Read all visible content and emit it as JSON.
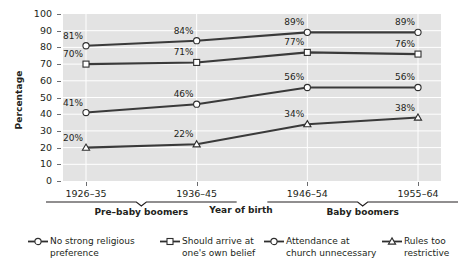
{
  "chart_data": {
    "type": "line",
    "title": "",
    "xlabel": "Year of birth",
    "ylabel": "Percentage",
    "ylim": [
      0,
      100
    ],
    "yticks": [
      "0",
      "10",
      "20",
      "30",
      "40",
      "50",
      "60",
      "70",
      "80",
      "90",
      "100"
    ],
    "grid": "horizontal-and-vertical",
    "legend_position": "bottom",
    "categories": [
      "1926–35",
      "1936–45",
      "1946–54",
      "1955–64"
    ],
    "category_groups": [
      {
        "label": "Pre–baby boomers",
        "categories": [
          "1926–35",
          "1936–45"
        ]
      },
      {
        "label": "Baby boomers",
        "categories": [
          "1946–54",
          "1955–64"
        ]
      }
    ],
    "series": [
      {
        "name": "No strong religious preference",
        "marker": "circle",
        "values": [
          81,
          84,
          89,
          89
        ],
        "labels": [
          "81%",
          "84%",
          "89%",
          "89%"
        ]
      },
      {
        "name": "Should arrive at one's own belief",
        "marker": "square",
        "values": [
          70,
          71,
          77,
          76
        ],
        "labels": [
          "70%",
          "71%",
          "77%",
          "76%"
        ]
      },
      {
        "name": "Attendance at church unnecessary",
        "marker": "circle",
        "values": [
          41,
          46,
          56,
          56
        ],
        "labels": [
          "41%",
          "46%",
          "56%",
          "56%"
        ]
      },
      {
        "name": "Rules too restrictive",
        "marker": "triangle",
        "values": [
          20,
          22,
          34,
          38
        ],
        "labels": [
          "20%",
          "22%",
          "34%",
          "38%"
        ]
      }
    ]
  },
  "legend": {
    "items": [
      {
        "label_line1": "No strong religious",
        "label_line2": "preference",
        "marker": "circle-marker-icon"
      },
      {
        "label_line1": "Should arrive at",
        "label_line2": "one's own belief",
        "marker": "square-marker-icon"
      },
      {
        "label_line1": "Attendance at",
        "label_line2": "church unnecessary",
        "marker": "circle-marker-icon"
      },
      {
        "label_line1": "Rules too",
        "label_line2": "restrictive",
        "marker": "triangle-marker-icon"
      }
    ]
  },
  "colors": {
    "plot_background": "#e3e3e3",
    "gridline": "#ffffff",
    "line": "#3a3a3a",
    "text": "#231f20",
    "tick": "#6d6e71",
    "marker_fill": "#ffffff"
  }
}
